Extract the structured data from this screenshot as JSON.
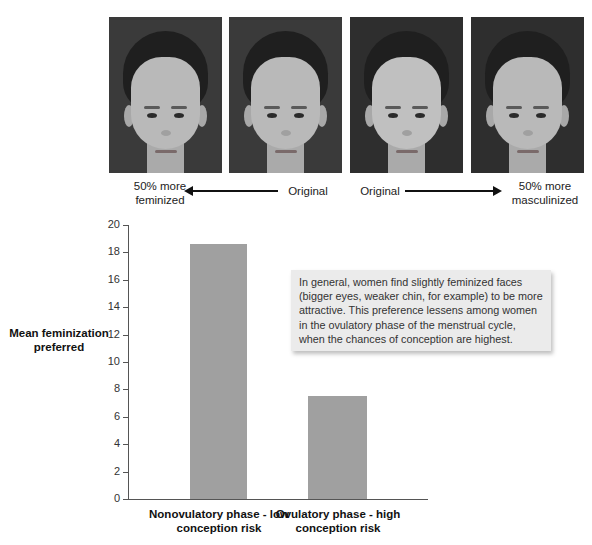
{
  "faces": [
    {
      "id": "face-feminized-male",
      "label": "50% more feminized"
    },
    {
      "id": "face-original-male",
      "label": "Original"
    },
    {
      "id": "face-original-female",
      "label": "Original"
    },
    {
      "id": "face-masculinized-female",
      "label": "50% more masculinized"
    }
  ],
  "captions": {
    "left_end": [
      "50% more",
      "feminized"
    ],
    "left_original": "Original",
    "right_original": "Original",
    "right_end": [
      "50% more",
      "masculinized"
    ]
  },
  "callout": {
    "text": "In general, women find slightly feminized faces (bigger eyes, weaker chin, for example) to be more attractive. This preference lessens among women in the ovulatory phase of the menstrual cycle, when the chances of conception are highest."
  },
  "chart_data": {
    "type": "bar",
    "title": "",
    "categories": [
      "Nonovulatory phase - low conception risk",
      "Ovulatory phase - high conception risk"
    ],
    "values": [
      18.6,
      7.5
    ],
    "xlabel": "",
    "ylabel": "Mean feminization preferred",
    "ylim": [
      0,
      20
    ],
    "yticks": [
      0,
      2,
      4,
      6,
      8,
      10,
      12,
      14,
      16,
      18,
      20
    ],
    "grid": false,
    "legend": null,
    "bar_color": "#a0a0a0",
    "annotation": "In general, women find slightly feminized faces (bigger eyes, weaker chin, for example) to be more attractive. This preference lessens among women in the ovulatory phase of the menstrual cycle, when the chances of conception are highest."
  },
  "axis": {
    "ylabel_lines": [
      "Mean feminization",
      "preferred"
    ],
    "cat1_lines": [
      "Nonovulatory phase - low",
      "conception risk"
    ],
    "cat2_lines": [
      "Ovulatory phase - high",
      "conception risk"
    ],
    "ticks": [
      "0",
      "2",
      "4",
      "6",
      "8",
      "10",
      "12",
      "14",
      "16",
      "18",
      "20"
    ]
  }
}
